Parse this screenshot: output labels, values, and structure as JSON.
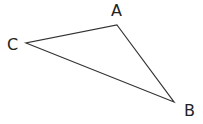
{
  "diagram": {
    "type": "triangle",
    "stroke_color": "#333333",
    "vertices": [
      {
        "label": "A",
        "x": 117,
        "y": 25
      },
      {
        "label": "B",
        "x": 174,
        "y": 102
      },
      {
        "label": "C",
        "x": 26,
        "y": 43
      }
    ],
    "labels": {
      "a": "A",
      "b": "B",
      "c": "C"
    }
  }
}
